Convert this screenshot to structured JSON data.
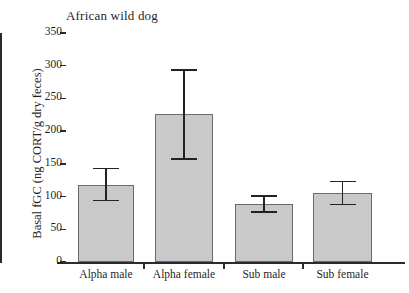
{
  "chart_data": {
    "type": "bar",
    "title": "African wild dog",
    "xlabel": "",
    "ylabel": "Basal fGC (ng CORT/g dry feces)",
    "ylim": [
      0,
      350
    ],
    "ytick_labels": [
      "0",
      "50",
      "100",
      "150",
      "200",
      "250",
      "300",
      "350"
    ],
    "ytick_values": [
      0,
      50,
      100,
      150,
      200,
      250,
      300,
      350
    ],
    "grid": false,
    "legend": null,
    "categories": [
      "Alpha male",
      "Alpha female",
      "Sub male",
      "Sub female"
    ],
    "values": [
      118,
      226,
      89,
      106
    ],
    "error_upper": [
      143,
      293,
      101,
      123
    ],
    "error_lower": [
      94,
      157,
      77,
      88
    ],
    "bar_fill_color": "#c9c9c9",
    "bar_edge_color": "#6a6a6a",
    "errorbar_color": "#222222",
    "axis_color": "#2b2b2b"
  }
}
